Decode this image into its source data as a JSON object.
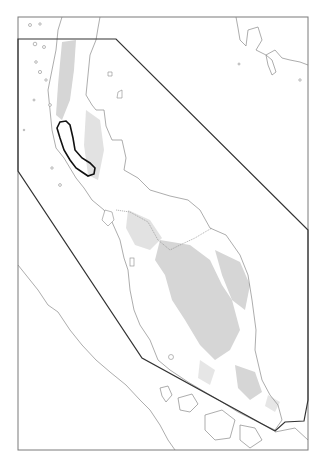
{
  "map": {
    "width": 324,
    "height": 468,
    "colors": {
      "background": "#ffffff",
      "frame": "#7a7a7a",
      "coastline": "#8a8a8a",
      "highland": "#d6d6d6",
      "study_polygon": "#333333",
      "highlight_region": "#111111"
    },
    "frame": {
      "x": 18,
      "y": 17,
      "width": 290,
      "height": 433
    },
    "study_polygon_points": "18,39 116,39 308,230 308,400 304,421 285,422 275,431 142,358 18,171",
    "highlight_region_points": "60,122 66,121 70,125 73,138 75,150 82,158 90,163 95,168 94,174 88,176 82,172 76,168 70,160 64,150 60,138 57,128"
  }
}
